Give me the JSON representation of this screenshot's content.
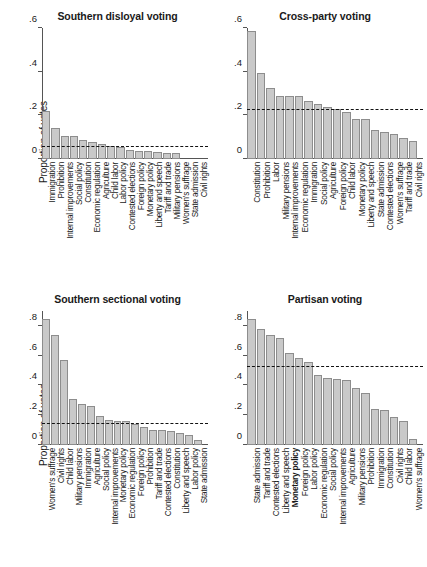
{
  "figure": {
    "ylabel": "Proportion of votes",
    "bar_fill": "#c9c9c9",
    "bar_stroke": "#8d8d8d",
    "refline_color": "#111111"
  },
  "chart_data": [
    {
      "type": "bar",
      "title": "Southern disloyal voting",
      "xlabel": "",
      "ylabel": "Proportion of votes",
      "ylim": [
        0,
        0.6
      ],
      "yticks": [
        0,
        0.2,
        0.4,
        0.6
      ],
      "ytick_labels": [
        "0",
        ".2",
        ".4",
        ".6"
      ],
      "grid": false,
      "reference_line": 0.055,
      "categories": [
        "Immigration",
        "Prohibition",
        "Internal improvements",
        "Social policy",
        "Constitution",
        "Economic regulation",
        "Agriculture",
        "Child labor",
        "Labor policy",
        "Contested elections",
        "Foreign policy",
        "Monetary policy",
        "Liberty and speech",
        "Tariff and trade",
        "Military pensions",
        "Women's suffrage",
        "State admission",
        "Civil rights"
      ],
      "values": [
        0.218,
        0.141,
        0.105,
        0.104,
        0.088,
        0.076,
        0.068,
        0.06,
        0.055,
        0.042,
        0.039,
        0.036,
        0.034,
        0.029,
        0.026,
        0.0,
        0.0,
        0.0
      ]
    },
    {
      "type": "bar",
      "title": "Cross-party voting",
      "xlabel": "",
      "ylabel": "",
      "ylim": [
        0,
        0.6
      ],
      "yticks": [
        0,
        0.2,
        0.4,
        0.6
      ],
      "ytick_labels": [
        "0",
        ".2",
        ".4",
        ".6"
      ],
      "grid": false,
      "reference_line": 0.225,
      "categories": [
        "Constitution",
        "Prohibition",
        "Labor",
        "Military pensions",
        "Internal improvements",
        "Economic regulation",
        "Immigration",
        "Social policy",
        "Agriculture",
        "Foreign policy",
        "Child labor",
        "Monetary policy",
        "Liberty and speech",
        "State admission",
        "Contested elections",
        "Women's suffrage",
        "Tariff and trade",
        "Civil rights"
      ],
      "values": [
        0.586,
        0.396,
        0.325,
        0.287,
        0.289,
        0.289,
        0.266,
        0.25,
        0.236,
        0.229,
        0.217,
        0.182,
        0.181,
        0.133,
        0.126,
        0.116,
        0.098,
        0.082
      ]
    },
    {
      "type": "bar",
      "title": "Southern sectional voting",
      "xlabel": "",
      "ylabel": "Proportion of votes",
      "ylim": [
        0,
        0.9
      ],
      "yticks": [
        0,
        0.2,
        0.4,
        0.6,
        0.8
      ],
      "ytick_labels": [
        "0",
        ".2",
        ".4",
        ".6",
        ".8"
      ],
      "grid": false,
      "reference_line": 0.142,
      "categories": [
        "Women's suffrage",
        "Civil rights",
        "Child labor",
        "Military pensions",
        "Immigration",
        "Agriculture",
        "Social policy",
        "Internal improvements",
        "Monetary policy",
        "Economic regulation",
        "Foreign policy",
        "Prohibition",
        "Tariff and trade",
        "Contested elections",
        "Constitution",
        "Liberty and speech",
        "Labor policy",
        "State admission"
      ],
      "values": [
        0.848,
        0.737,
        0.571,
        0.309,
        0.276,
        0.259,
        0.193,
        0.17,
        0.164,
        0.163,
        0.142,
        0.122,
        0.104,
        0.102,
        0.096,
        0.079,
        0.064,
        0.034
      ]
    },
    {
      "type": "bar",
      "title": "Partisan voting",
      "xlabel": "",
      "ylabel": "",
      "ylim": [
        0,
        0.9
      ],
      "yticks": [
        0,
        0.2,
        0.4,
        0.6,
        0.8
      ],
      "ytick_labels": [
        "0",
        ".2",
        ".4",
        ".6",
        ".8"
      ],
      "grid": false,
      "reference_line": 0.521,
      "categories": [
        "State admission",
        "Tariff and trade",
        "Contested elections",
        "Liberty and speech",
        "Monetary policy",
        "Foreign policy",
        "Labor policy",
        "Economic regulation",
        "Social policy",
        "Internal improvements",
        "Agriculture",
        "Military pensions",
        "Prohibition",
        "Immigration",
        "Constitution",
        "Civil rights",
        "Child labor",
        "Women's suffrage"
      ],
      "values": [
        0.846,
        0.779,
        0.738,
        0.718,
        0.621,
        0.587,
        0.56,
        0.472,
        0.452,
        0.441,
        0.436,
        0.385,
        0.349,
        0.242,
        0.232,
        0.191,
        0.158,
        0.041
      ],
      "emphasized_categories": [
        "Monetary policy"
      ]
    }
  ]
}
